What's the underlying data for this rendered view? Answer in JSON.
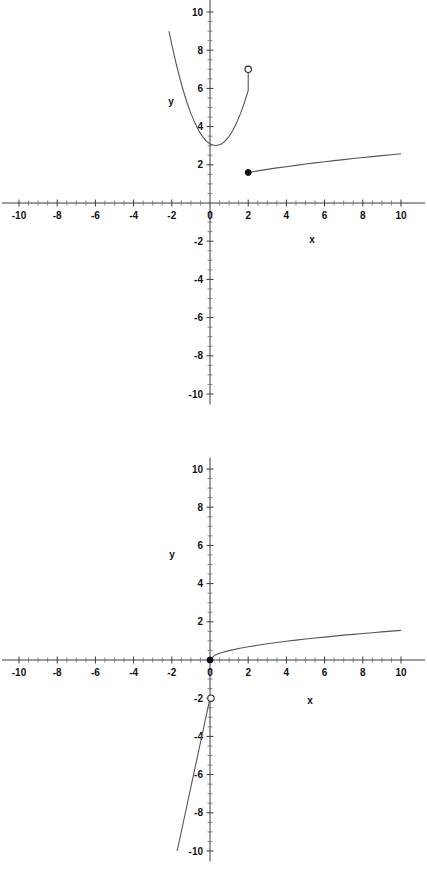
{
  "page": {
    "background": "#ffffff",
    "ink": "#1a1a1a",
    "width": 427,
    "height": 884
  },
  "chart_data": [
    {
      "id": "graph-1",
      "type": "line",
      "title": "",
      "xlabel": "x",
      "ylabel": "y",
      "xlim": [
        -10,
        10
      ],
      "ylim": [
        -10,
        10
      ],
      "grid": false,
      "legend": null,
      "x_ticks": [
        -10,
        -8,
        -6,
        -4,
        -2,
        0,
        2,
        4,
        6,
        8,
        10
      ],
      "x_tick_labels": [
        "-10",
        "-8",
        "-6",
        "-4",
        "-2",
        "0",
        "2",
        "4",
        "6",
        "8",
        "10"
      ],
      "y_ticks": [
        -10,
        -8,
        -6,
        -4,
        -2,
        2,
        4,
        6,
        8,
        10
      ],
      "y_tick_labels": [
        "-10",
        "-8",
        "-6",
        "-4",
        "-2",
        "2",
        "4",
        "6",
        "8",
        "10"
      ],
      "minor_tick_step": 0.5,
      "view_clip_top": 10.8,
      "series": [
        {
          "name": "parabola-branch",
          "kind": "quadratic",
          "domain": [
            -2.15,
            2.0
          ],
          "vertex": [
            0.3,
            3.0
          ],
          "leading_coeff": 1.0,
          "points": [
            [
              -2.15,
              9.0
            ],
            [
              -2.0,
              8.29
            ],
            [
              -1.8,
              7.41
            ],
            [
              -1.6,
              6.61
            ],
            [
              -1.4,
              5.89
            ],
            [
              -1.2,
              5.25
            ],
            [
              -1.0,
              4.69
            ],
            [
              -0.8,
              4.21
            ],
            [
              -0.6,
              3.81
            ],
            [
              -0.4,
              3.49
            ],
            [
              -0.2,
              3.25
            ],
            [
              0.0,
              3.09
            ],
            [
              0.3,
              3.0
            ],
            [
              0.6,
              3.09
            ],
            [
              0.8,
              3.25
            ],
            [
              1.0,
              3.49
            ],
            [
              1.2,
              3.81
            ],
            [
              1.4,
              4.21
            ],
            [
              1.6,
              4.69
            ],
            [
              1.8,
              5.25
            ],
            [
              2.0,
              5.89
            ]
          ],
          "endpoint_right": [
            2.0,
            7.0
          ],
          "endpoint_marker": "open"
        },
        {
          "name": "sqrt-branch",
          "kind": "sqrt",
          "domain": [
            2.0,
            10.0
          ],
          "points": [
            [
              2.0,
              1.6
            ],
            [
              2.5,
              1.68
            ],
            [
              3.0,
              1.76
            ],
            [
              3.5,
              1.84
            ],
            [
              4.0,
              1.9
            ],
            [
              4.5,
              1.97
            ],
            [
              5.0,
              2.04
            ],
            [
              5.5,
              2.1
            ],
            [
              6.0,
              2.16
            ],
            [
              6.5,
              2.22
            ],
            [
              7.0,
              2.27
            ],
            [
              7.5,
              2.33
            ],
            [
              8.0,
              2.38
            ],
            [
              8.5,
              2.43
            ],
            [
              9.0,
              2.48
            ],
            [
              9.5,
              2.53
            ],
            [
              10.0,
              2.58
            ]
          ],
          "endpoint_left": [
            2.0,
            1.6
          ],
          "endpoint_marker": "closed"
        }
      ],
      "markers": [
        {
          "name": "open-point",
          "x": 2.0,
          "y": 7.0,
          "style": "open"
        },
        {
          "name": "closed-point",
          "x": 2.0,
          "y": 1.6,
          "style": "closed"
        }
      ]
    },
    {
      "id": "graph-2",
      "type": "line",
      "title": "",
      "xlabel": "x",
      "ylabel": "y",
      "xlim": [
        -10,
        10
      ],
      "ylim": [
        -10,
        10
      ],
      "grid": false,
      "legend": null,
      "x_ticks": [
        -10,
        -8,
        -6,
        -4,
        -2,
        0,
        2,
        4,
        6,
        8,
        10
      ],
      "x_tick_labels": [
        "-10",
        "-8",
        "-6",
        "-4",
        "-2",
        "0",
        "2",
        "4",
        "6",
        "8",
        "10"
      ],
      "y_ticks": [
        -10,
        -8,
        -6,
        -4,
        -2,
        2,
        4,
        6,
        8,
        10
      ],
      "y_tick_labels": [
        "-10",
        "-8",
        "-6",
        "-4",
        "-2",
        "2",
        "4",
        "6",
        "8",
        "10"
      ],
      "minor_tick_step": 0.5,
      "series": [
        {
          "name": "sqrt-branch",
          "kind": "sqrt",
          "domain": [
            0.0,
            10.0
          ],
          "points": [
            [
              0.0,
              0.0
            ],
            [
              0.25,
              0.25
            ],
            [
              0.5,
              0.35
            ],
            [
              1.0,
              0.49
            ],
            [
              1.5,
              0.6
            ],
            [
              2.0,
              0.69
            ],
            [
              2.5,
              0.77
            ],
            [
              3.0,
              0.85
            ],
            [
              3.5,
              0.92
            ],
            [
              4.0,
              0.98
            ],
            [
              4.5,
              1.04
            ],
            [
              5.0,
              1.1
            ],
            [
              5.5,
              1.15
            ],
            [
              6.0,
              1.2
            ],
            [
              6.5,
              1.25
            ],
            [
              7.0,
              1.3
            ],
            [
              7.5,
              1.34
            ],
            [
              8.0,
              1.39
            ],
            [
              8.5,
              1.43
            ],
            [
              9.0,
              1.47
            ],
            [
              9.5,
              1.51
            ],
            [
              10.0,
              1.55
            ]
          ],
          "endpoint_left": [
            0.0,
            0.0
          ],
          "endpoint_marker": "closed"
        },
        {
          "name": "steep-line-branch",
          "kind": "linear",
          "slope": 4.7,
          "intercept": -2.0,
          "domain": [
            -1.72,
            0.0
          ],
          "points": [
            [
              -1.72,
              -10.0
            ],
            [
              0.0,
              -2.0
            ]
          ],
          "endpoint_right": [
            0.0,
            -2.0
          ],
          "endpoint_marker": "open"
        }
      ],
      "markers": [
        {
          "name": "closed-point",
          "x": 0.0,
          "y": 0.0,
          "style": "closed"
        },
        {
          "name": "open-point",
          "x": 0.05,
          "y": -2.0,
          "style": "open"
        }
      ]
    }
  ]
}
